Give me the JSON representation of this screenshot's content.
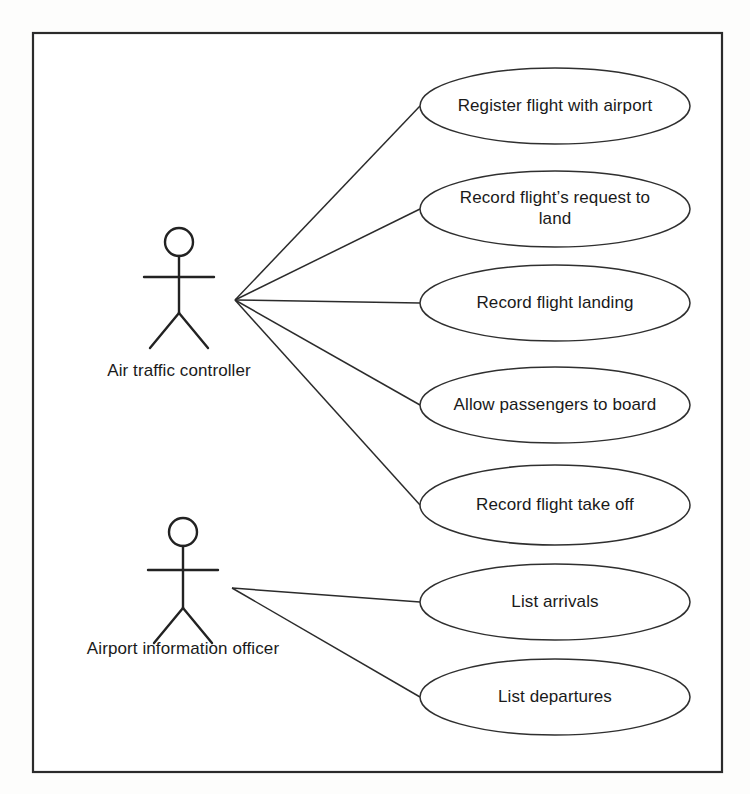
{
  "diagram": {
    "kind": "uml-use-case-diagram",
    "page_bleed_text": "· · · · · · · · · · · · · · · · · · · ·",
    "frame": {
      "x": 33,
      "y": 33,
      "width": 689,
      "height": 739
    },
    "colors": {
      "background": "#ffffff",
      "stroke": "#2b2b2b",
      "text": "#1a1a1a",
      "ellipse_fill": "#ffffff"
    },
    "actors": [
      {
        "id": "air-traffic-controller",
        "label": "Air traffic controller",
        "head_cx": 179,
        "head_cy": 242,
        "head_r": 14,
        "body_top": 256,
        "body_bottom": 313,
        "arm_y": 277,
        "arm_left": 144,
        "arm_right": 214,
        "leg_left_x": 150,
        "leg_right_x": 208,
        "leg_y": 348,
        "label_cx": 179,
        "label_y": 360,
        "hub_x": 235,
        "hub_y": 300
      },
      {
        "id": "airport-information-officer",
        "label": "Airport information officer",
        "head_cx": 183,
        "head_cy": 532,
        "head_r": 14,
        "body_top": 546,
        "body_bottom": 608,
        "arm_y": 570,
        "arm_left": 148,
        "arm_right": 218,
        "leg_left_x": 154,
        "leg_right_x": 212,
        "leg_y": 643,
        "label_cx": 183,
        "label_y": 638,
        "hub_x": 232,
        "hub_y": 588
      }
    ],
    "use_cases": [
      {
        "id": "register-flight-with-airport",
        "label": "Register flight with airport",
        "lines": [
          "Register flight with airport"
        ],
        "cx": 555,
        "cy": 106,
        "rx": 135,
        "ry": 38,
        "actor": "air-traffic-controller"
      },
      {
        "id": "record-flight-request-to-land",
        "label": "Record flight’s request to land",
        "lines": [
          "Record flight’s request to",
          "land"
        ],
        "cx": 555,
        "cy": 209,
        "rx": 135,
        "ry": 38,
        "actor": "air-traffic-controller"
      },
      {
        "id": "record-flight-landing",
        "label": "Record flight landing",
        "lines": [
          "Record flight landing"
        ],
        "cx": 555,
        "cy": 303,
        "rx": 135,
        "ry": 38,
        "actor": "air-traffic-controller"
      },
      {
        "id": "allow-passengers-to-board",
        "label": "Allow passengers to board",
        "lines": [
          "Allow passengers to board"
        ],
        "cx": 555,
        "cy": 405,
        "rx": 135,
        "ry": 38,
        "actor": "air-traffic-controller"
      },
      {
        "id": "record-flight-take-off",
        "label": "Record flight take off",
        "lines": [
          "Record flight take off"
        ],
        "cx": 555,
        "cy": 505,
        "rx": 135,
        "ry": 40,
        "actor": "air-traffic-controller"
      },
      {
        "id": "list-arrivals",
        "label": "List arrivals",
        "lines": [
          "List arrivals"
        ],
        "cx": 555,
        "cy": 602,
        "rx": 135,
        "ry": 38,
        "actor": "airport-information-officer"
      },
      {
        "id": "list-departures",
        "label": "List departures",
        "lines": [
          "List departures"
        ],
        "cx": 555,
        "cy": 697,
        "rx": 135,
        "ry": 38,
        "actor": "airport-information-officer"
      }
    ],
    "associations": [
      {
        "from": "air-traffic-controller",
        "to": "register-flight-with-airport"
      },
      {
        "from": "air-traffic-controller",
        "to": "record-flight-request-to-land"
      },
      {
        "from": "air-traffic-controller",
        "to": "record-flight-landing"
      },
      {
        "from": "air-traffic-controller",
        "to": "allow-passengers-to-board"
      },
      {
        "from": "air-traffic-controller",
        "to": "record-flight-take-off"
      },
      {
        "from": "airport-information-officer",
        "to": "list-arrivals"
      },
      {
        "from": "airport-information-officer",
        "to": "list-departures"
      }
    ]
  }
}
